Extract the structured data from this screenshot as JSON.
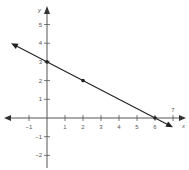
{
  "chart_data": {
    "type": "line",
    "title": "",
    "xlabel": "x",
    "ylabel": "y",
    "xlim": [
      -2,
      7.5
    ],
    "ylim": [
      -3,
      6.5
    ],
    "x_ticks": [
      -1,
      1,
      2,
      3,
      4,
      5,
      6,
      7
    ],
    "y_ticks": [
      -2,
      -1,
      1,
      2,
      3,
      4,
      5
    ],
    "grid": false,
    "series": [
      {
        "name": "line",
        "equation": "y = -x/2 + 3",
        "x": [
          -2,
          7
        ],
        "y": [
          4,
          -0.5
        ]
      }
    ],
    "points": [
      {
        "x": 0,
        "y": 3
      },
      {
        "x": 2,
        "y": 2
      },
      {
        "x": 6,
        "y": 0
      }
    ]
  },
  "labels": {
    "x_axis": "x",
    "y_axis": "y"
  }
}
